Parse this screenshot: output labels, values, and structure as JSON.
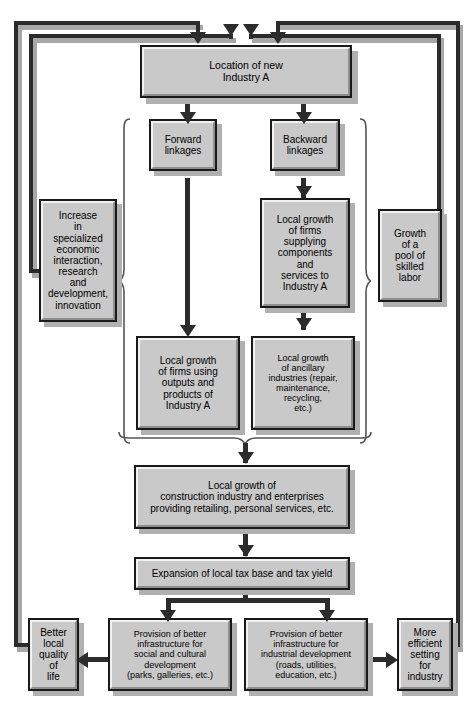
{
  "diagram": {
    "palette": {
      "box_fill": "#c9c9c9",
      "box_border": "#1a1a1a",
      "highlight": "#f2f2f2",
      "lowlight": "#8e8e8e",
      "shadow": "#b0b0b0",
      "line": "#2b2b2b",
      "line_shadow": "#a8a8a8",
      "background": "#ffffff"
    },
    "nodes": {
      "location": "Location of new\nIndustry A",
      "forward_linkages": "Forward\nlinkages",
      "backward_linkages": "Backward\nlinkages",
      "increase_interaction": "Increase\nin\nspecialized\neconomic\ninteraction,\nresearch\nand\ndevelopment,\ninnovation",
      "supplying_firms": "Local growth\nof firms\nsupplying\ncomponents\nand\nservices to\nIndustry A",
      "skilled_labor": "Growth\nof a\npool of\nskilled\nlabor",
      "using_outputs": "Local growth\nof firms using\noutputs and\nproducts of\nIndustry A",
      "ancillary": "Local growth\nof ancillary\nindustries (repair,\nmaintenance,\nrecycling,\netc.)",
      "construction": "Local growth of\nconstruction industry and enterprises\nproviding retailing, personal services, etc.",
      "tax_base": "Expansion of local tax base and tax yield",
      "quality_of_life": "Better\nlocal\nquality\nof\nlife",
      "social_infra": "Provision of better\ninfrastructure for\nsocial and cultural\ndevelopment\n(parks, galleries, etc.)",
      "industrial_infra": "Provision of better\ninfrastructure for\nindustrial development\n(roads, utilities,\neducation, etc.)",
      "efficient_setting": "More\nefficient\nsetting\nfor\nindustry"
    },
    "edges": [
      {
        "from": "location",
        "to": "forward_linkages",
        "type": "down-arrow"
      },
      {
        "from": "location",
        "to": "backward_linkages",
        "type": "down-arrow"
      },
      {
        "from": "forward_linkages",
        "to": "using_outputs",
        "type": "down-arrow"
      },
      {
        "from": "backward_linkages",
        "to": "supplying_firms",
        "type": "down-arrow"
      },
      {
        "from": "supplying_firms",
        "to": "ancillary",
        "type": "down-arrow"
      },
      {
        "from": "linkage-group",
        "to": "construction",
        "type": "down-arrow"
      },
      {
        "from": "linkage-group",
        "to": "increase_interaction",
        "type": "left-brace"
      },
      {
        "from": "linkage-group",
        "to": "skilled_labor",
        "type": "right-brace"
      },
      {
        "from": "construction",
        "to": "tax_base",
        "type": "down-arrow"
      },
      {
        "from": "tax_base",
        "to": "social_infra",
        "type": "down-arrow"
      },
      {
        "from": "tax_base",
        "to": "industrial_infra",
        "type": "down-arrow"
      },
      {
        "from": "social_infra",
        "to": "quality_of_life",
        "type": "left-arrow"
      },
      {
        "from": "industrial_infra",
        "to": "efficient_setting",
        "type": "right-arrow"
      },
      {
        "from": "quality_of_life",
        "to": "location",
        "type": "feedback-loop-outer-left"
      },
      {
        "from": "increase_interaction",
        "to": "location",
        "type": "feedback-loop-inner-left"
      },
      {
        "from": "skilled_labor",
        "to": "location",
        "type": "feedback-loop-inner-right"
      },
      {
        "from": "efficient_setting",
        "to": "location",
        "type": "feedback-loop-outer-right"
      }
    ],
    "feedback_arrow_count": 4
  }
}
